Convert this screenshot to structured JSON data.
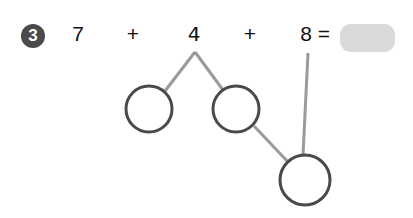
{
  "problem": {
    "number": "3",
    "terms": [
      "7",
      "4",
      "8"
    ],
    "operators": [
      "+",
      "+"
    ],
    "equals": "=",
    "answer_value": ""
  },
  "colors": {
    "badge_bg": "#4a4a4a",
    "badge_text": "#ffffff",
    "text": "#111111",
    "answer_box": "#d9d9d9",
    "connector_line": "#9a9a9a",
    "circle_stroke": "#4a4a4a"
  },
  "number_bond": {
    "circles": [
      {
        "id": "left",
        "cx": 149,
        "cy": 109,
        "r": 23,
        "value": ""
      },
      {
        "id": "middle",
        "cx": 236,
        "cy": 109,
        "r": 23,
        "value": ""
      },
      {
        "id": "bottom",
        "cx": 305,
        "cy": 180,
        "r": 25,
        "value": ""
      }
    ],
    "lines": [
      {
        "from": "apex-under-4",
        "x1": 195,
        "y1": 52,
        "x2": 165,
        "y2": 91
      },
      {
        "from": "apex-under-4",
        "x1": 195,
        "y1": 52,
        "x2": 223,
        "y2": 90
      },
      {
        "from": "middle-circle",
        "x1": 254,
        "y1": 126,
        "x2": 289,
        "y2": 163
      },
      {
        "from": "under-8",
        "x1": 308,
        "y1": 53,
        "x2": 303,
        "y2": 155
      }
    ]
  }
}
